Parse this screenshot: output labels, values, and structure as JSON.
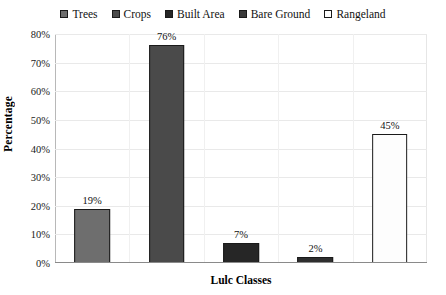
{
  "chart_data": {
    "type": "bar",
    "title": "",
    "xlabel": "Lulc Classes",
    "ylabel": "Percentage",
    "categories": [
      "Trees",
      "Crops",
      "Built Area",
      "Bare Ground",
      "Rangeland"
    ],
    "values": [
      19,
      76,
      7,
      2,
      45
    ],
    "value_labels": [
      "19%",
      "76%",
      "7%",
      "2%",
      "45%"
    ],
    "ylim": [
      0,
      80
    ],
    "ytick_labels": [
      "0%",
      "10%",
      "20%",
      "30%",
      "40%",
      "50%",
      "60%",
      "70%",
      "80%"
    ],
    "ytick_values": [
      0,
      10,
      20,
      30,
      40,
      50,
      60,
      70,
      80
    ],
    "grid": true,
    "grid_axis": "both",
    "legend_position": "top",
    "series": [
      {
        "name": "Lulc Percentage",
        "values": [
          19,
          76,
          7,
          2,
          45
        ]
      }
    ],
    "colors": [
      "#6e6e6e",
      "#4a4a4a",
      "#262626",
      "#2e2e2e",
      "#fdfdfd"
    ],
    "bar_border_color": "#1a1a1a"
  },
  "legend": {
    "items": [
      {
        "label": "Trees",
        "color": "#6e6e6e"
      },
      {
        "label": "Crops",
        "color": "#4a4a4a"
      },
      {
        "label": "Built Area",
        "color": "#262626"
      },
      {
        "label": "Bare Ground",
        "color": "#3a3a3a"
      },
      {
        "label": "Rangeland",
        "color": "#fdfdfd"
      }
    ]
  }
}
